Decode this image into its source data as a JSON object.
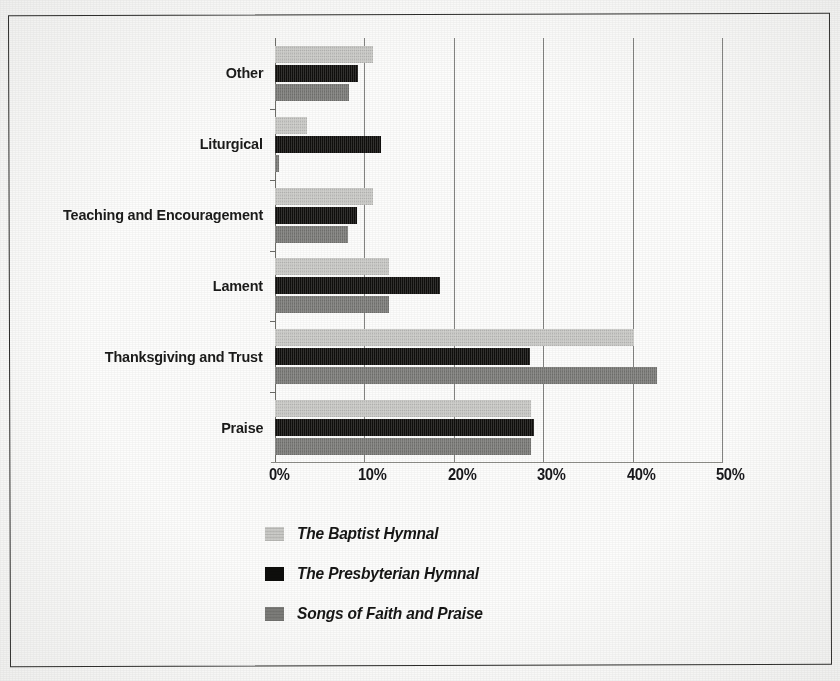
{
  "chart_data": {
    "type": "bar",
    "orientation": "horizontal",
    "title": "",
    "subtitle": "",
    "xlabel": "",
    "ylabel": "",
    "xlim": [
      0,
      50
    ],
    "xunit": "%",
    "grid": true,
    "legend_position": "bottom-left",
    "categories": [
      "Other",
      "Liturgical",
      "Teaching and Encouragement",
      "Lament",
      "Thanksgiving and Trust",
      "Praise"
    ],
    "tick_labels": [
      "0%",
      "10%",
      "20%",
      "30%",
      "40%",
      "50%"
    ],
    "tick_values": [
      0,
      10,
      20,
      30,
      40,
      50
    ],
    "series": [
      {
        "name": "The Baptist Hymnal",
        "color": "#c9c9c6",
        "values": [
          11.0,
          3.6,
          11.0,
          12.7,
          40.2,
          28.6
        ]
      },
      {
        "name": "The Presbyterian Hymnal",
        "color": "#100f0d",
        "values": [
          9.3,
          11.9,
          9.2,
          18.5,
          28.5,
          29.0
        ]
      },
      {
        "name": "Songs of Faith and Praise",
        "color": "#7b7b78",
        "values": [
          8.3,
          0.4,
          8.2,
          12.7,
          42.7,
          28.6
        ]
      }
    ]
  },
  "legend": {
    "items": [
      {
        "label": "The Baptist Hymnal",
        "swatch": "#c9c9c6"
      },
      {
        "label": "The Presbyterian Hymnal",
        "swatch": "#100f0d"
      },
      {
        "label": "Songs of Faith and Praise",
        "swatch": "#7b7b78"
      }
    ]
  }
}
